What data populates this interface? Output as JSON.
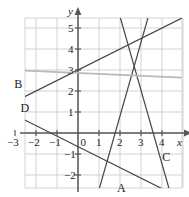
{
  "figure": {
    "type": "coordinate-plane-line-graph",
    "background": "#ffffff",
    "grid_color": "#c8c8cc",
    "line_color": "#4a4a4a",
    "faint_line_color": "#b9b9bd",
    "text_color": "#1a1a1a"
  },
  "axes": {
    "x_axis_label": "x",
    "y_axis_label": "y",
    "x_ticks": [
      {
        "label": "−3",
        "value": -3
      },
      {
        "label": "−2",
        "value": -2
      },
      {
        "label": "−1",
        "value": -1
      },
      {
        "label": "1",
        "value": 1
      },
      {
        "label": "2",
        "value": 2
      },
      {
        "label": "3",
        "value": 3
      },
      {
        "label": "4",
        "value": 4
      }
    ],
    "y_ticks": [
      {
        "label": "5",
        "value": 5
      },
      {
        "label": "4",
        "value": 4
      },
      {
        "label": "3",
        "value": 3
      },
      {
        "label": "2",
        "value": 2
      },
      {
        "label": "1",
        "value": 1
      },
      {
        "label": "−1",
        "value": -1
      },
      {
        "label": "−2",
        "value": -2
      }
    ],
    "origin_label": "0",
    "xlim": [
      -4.0,
      4.9
    ],
    "ylim": [
      -2.75,
      5.9
    ],
    "grid": true
  },
  "chart_data": {
    "type": "line",
    "title": "",
    "xlabel": "x",
    "ylabel": "y",
    "xlim": [
      -4.0,
      4.9
    ],
    "ylim": [
      -2.75,
      5.9
    ],
    "grid": true,
    "legend_position": "inline-labels",
    "series": [
      {
        "name": "A",
        "label": "A",
        "description": "steep ascending line",
        "slope": 3.6,
        "intercept": -6.3,
        "x_intercept": 1.75,
        "points": [
          [
            1.0,
            -2.7
          ],
          [
            1.75,
            0.0
          ],
          [
            2.5,
            2.7
          ],
          [
            3.45,
            5.9
          ]
        ],
        "label_position": [
          2.05,
          -2.62
        ]
      },
      {
        "name": "B",
        "label": "B",
        "description": "gentle ascending line, y-intercept 3",
        "slope": 0.5,
        "intercept": 3.0,
        "y_intercept": 3.0,
        "points": [
          [
            -4.0,
            1.0
          ],
          [
            0.0,
            3.0
          ],
          [
            4.9,
            5.45
          ]
        ],
        "label_position": [
          -2.85,
          2.35
        ]
      },
      {
        "name": "C",
        "label": "C",
        "description": "steep descending line",
        "slope": -3.6,
        "intercept": 12.95,
        "x_intercept": 3.6,
        "points": [
          [
            1.9,
            5.9
          ],
          [
            3.6,
            0.0
          ],
          [
            4.35,
            -2.7
          ]
        ],
        "label_position": [
          4.2,
          -1.15
        ]
      },
      {
        "name": "D",
        "label": "D",
        "description": "gentle descending line",
        "slope": -0.5,
        "intercept": -0.65,
        "x_intercept": -1.3,
        "points": [
          [
            -4.0,
            1.35
          ],
          [
            -1.3,
            0.0
          ],
          [
            4.6,
            -2.95
          ]
        ],
        "label_position": [
          -2.55,
          1.2
        ]
      },
      {
        "name": "faint-horizontal",
        "label": "",
        "description": "faint near-horizontal grey line",
        "slope": -0.045,
        "intercept": 2.86,
        "points": [
          [
            -4.5,
            3.06
          ],
          [
            4.9,
            2.64
          ]
        ],
        "label_position": null
      }
    ]
  }
}
